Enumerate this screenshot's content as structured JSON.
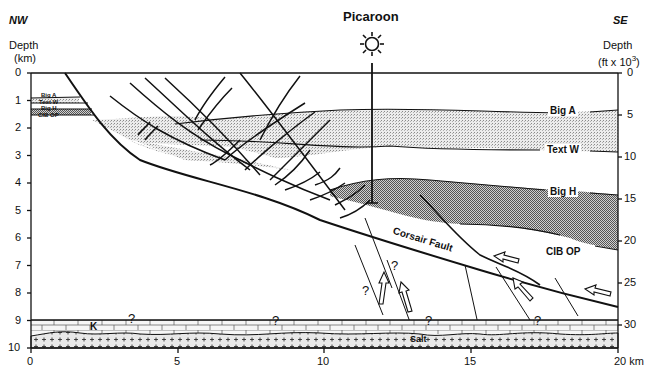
{
  "header": {
    "nw_label": "NW",
    "se_label": "SE",
    "well_name": "Picaroon",
    "well_icon": "sun-wellhead-icon"
  },
  "left_axis": {
    "title_line1": "Depth",
    "title_line2": "(km)",
    "ticks": [
      "0",
      "1",
      "2",
      "3",
      "4",
      "5",
      "6",
      "7",
      "8",
      "9",
      "10"
    ]
  },
  "right_axis": {
    "title_line1": "Depth",
    "title_line2": "(ft x 10",
    "title_sup": "3",
    "title_close": ")",
    "ticks": [
      "0",
      "5",
      "10",
      "15",
      "20",
      "25",
      "30"
    ]
  },
  "bottom_axis": {
    "ticks": [
      "0",
      "5",
      "10",
      "15",
      "20 km"
    ]
  },
  "horizons": {
    "big_a": "Big A",
    "text_w": "Text W",
    "big_h": "Big H",
    "cib_op": "CIB OP"
  },
  "left_inset_labels": [
    "Big A",
    "Text W",
    "Big H",
    "CIB OP"
  ],
  "units": {
    "k": "K",
    "salt": "Salt"
  },
  "fault_label": "Corsair Fault",
  "uncertainty_marks": [
    "?",
    "?",
    "?",
    "?",
    "?",
    "?"
  ],
  "colors": {
    "line": "#111111",
    "light_fill": "#d8d8d8",
    "dark_fill": "#9a9a9a",
    "background": "#ffffff"
  }
}
